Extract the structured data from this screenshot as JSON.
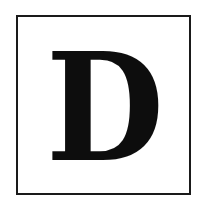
{
  "tile": {
    "letter": "D",
    "letter_color": "#0d0d0d",
    "border_color": "#1a1a1a",
    "background_color": "#ffffff"
  }
}
